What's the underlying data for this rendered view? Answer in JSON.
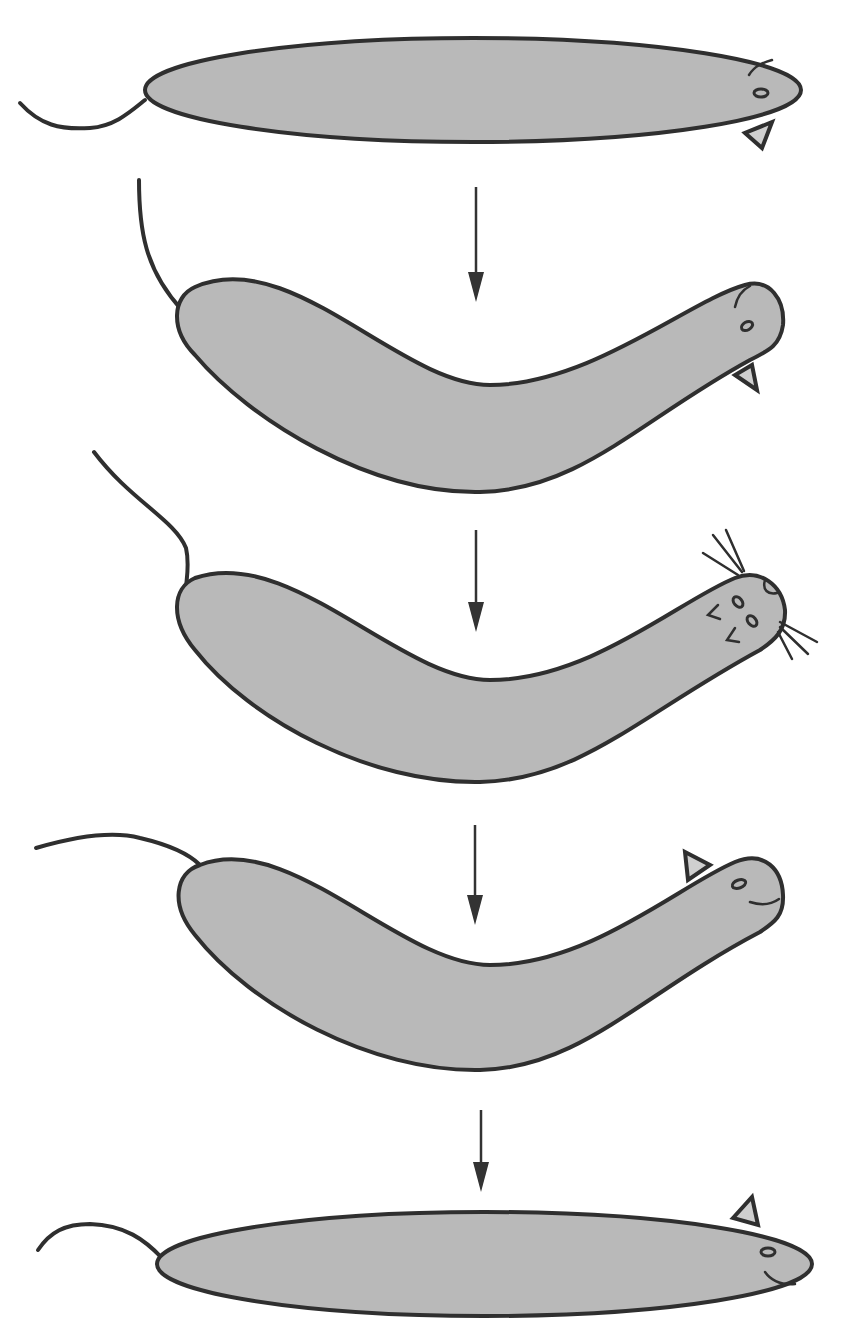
{
  "figure": {
    "colors": {
      "body_fill": "#b9b9b9",
      "outline": "#2f2f2f",
      "arrow": "#333333",
      "background": "#ffffff"
    },
    "stages": [
      {
        "index": 1,
        "posture": "straight",
        "head_features": [
          "ear-down",
          "eye",
          "ear-line"
        ]
      },
      {
        "index": 2,
        "posture": "curved",
        "head_features": [
          "ear-down",
          "eye",
          "ear-line"
        ]
      },
      {
        "index": 3,
        "posture": "curved",
        "head_features": [
          "whiskers",
          "eyes",
          "nose"
        ]
      },
      {
        "index": 4,
        "posture": "curved",
        "head_features": [
          "ear-up",
          "eye",
          "mouth"
        ]
      },
      {
        "index": 5,
        "posture": "straight",
        "head_features": [
          "ear-up",
          "eye",
          "mouth"
        ]
      }
    ],
    "arrows": [
      {
        "from": 1,
        "to": 2,
        "direction": "down"
      },
      {
        "from": 2,
        "to": 3,
        "direction": "down"
      },
      {
        "from": 3,
        "to": 4,
        "direction": "down"
      },
      {
        "from": 4,
        "to": 5,
        "direction": "down"
      }
    ]
  }
}
